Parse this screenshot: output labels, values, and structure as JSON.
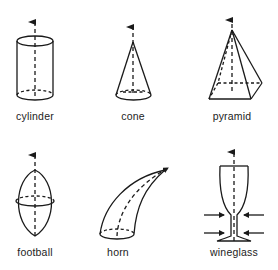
{
  "diagram": {
    "type": "shape-axis-illustration",
    "colors": {
      "stroke": "#1a1a1a",
      "background": "#ffffff",
      "text": "#222222"
    },
    "shapes": [
      {
        "id": "cylinder",
        "label": "cylinder",
        "has_axis_arrow": true
      },
      {
        "id": "cone",
        "label": "cone",
        "has_axis_arrow": true
      },
      {
        "id": "pyramid",
        "label": "pyramid",
        "has_axis_arrow": true
      },
      {
        "id": "football",
        "label": "football",
        "has_axis_arrow": true
      },
      {
        "id": "horn",
        "label": "horn",
        "has_axis_arrow": true,
        "axis": "curved"
      },
      {
        "id": "wineglass",
        "label": "wineglass",
        "has_axis_arrow": true,
        "compression_arrows": 4
      }
    ]
  }
}
